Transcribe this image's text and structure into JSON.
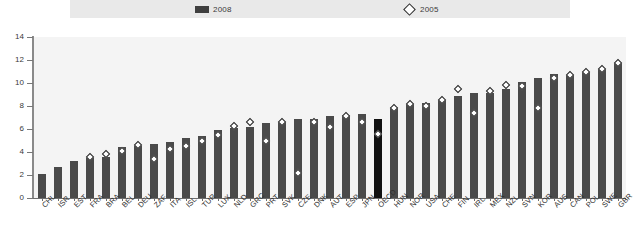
{
  "chart_data": {
    "type": "bar",
    "title": "",
    "subtitle": "",
    "xlabel": "",
    "ylabel": "",
    "ylim": [
      0,
      14
    ],
    "yticks": [
      0,
      2,
      4,
      6,
      8,
      10,
      12,
      14
    ],
    "grid": false,
    "legend_position": "top",
    "legend": [
      {
        "name": "2008",
        "marker": "filled-square",
        "color": "#4a4a4a"
      },
      {
        "name": "2005",
        "marker": "open-diamond",
        "color": "#ffffff"
      }
    ],
    "highlight_category": "OECD",
    "highlight_color": "#111111",
    "categories": [
      "CHL",
      "ISR",
      "EST",
      "FRA",
      "BRA",
      "BEL",
      "DEU",
      "ZAF",
      "ITA",
      "ISL",
      "TUR",
      "LUX",
      "NLD",
      "GRC",
      "PRT",
      "SVK",
      "CZE",
      "DNK",
      "AUT",
      "ESP",
      "JPN",
      "OECD",
      "HUN",
      "NOR",
      "USA",
      "CHE",
      "FIN",
      "IRL",
      "MEX",
      "NZL",
      "SVN",
      "KOR",
      "AUS",
      "CAN",
      "POL",
      "SWE",
      "GBR"
    ],
    "series": [
      {
        "name": "2008",
        "type": "bar",
        "values": [
          2.1,
          2.7,
          3.2,
          3.5,
          3.6,
          4.4,
          4.5,
          4.7,
          4.9,
          5.2,
          5.4,
          5.9,
          6.1,
          6.2,
          6.5,
          6.6,
          6.9,
          6.9,
          7.1,
          7.2,
          7.3,
          6.9,
          7.9,
          8.2,
          8.3,
          8.5,
          8.9,
          9.1,
          9.1,
          9.5,
          10.1,
          10.4,
          10.8,
          10.7,
          11.0,
          11.2,
          11.7
        ]
      },
      {
        "name": "2005",
        "type": "scatter",
        "values": [
          null,
          null,
          null,
          3.6,
          3.8,
          4.1,
          4.6,
          3.4,
          4.3,
          4.5,
          5.0,
          5.5,
          6.3,
          6.6,
          5.0,
          6.6,
          2.2,
          6.6,
          6.2,
          7.1,
          6.6,
          5.6,
          7.8,
          8.2,
          8.0,
          8.5,
          9.5,
          7.4,
          9.3,
          9.8,
          9.7,
          7.8,
          10.4,
          10.7,
          11.0,
          11.2,
          11.7
        ]
      }
    ]
  }
}
